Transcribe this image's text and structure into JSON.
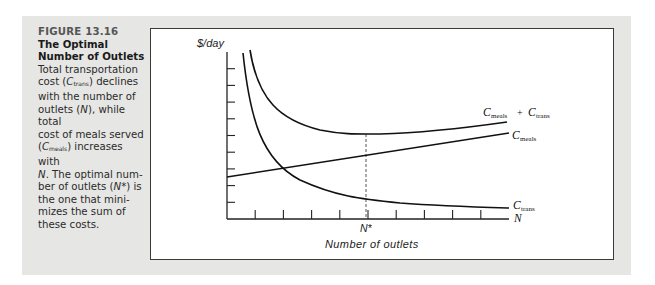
{
  "caption": {
    "figure_label": "FIGURE 13.16",
    "title_line1": "The Optimal",
    "title_line2": "Number of Outlets",
    "body_lines": [
      [
        "Total transportation"
      ],
      [
        "cost (",
        "C",
        "trans",
        ") declines"
      ],
      [
        "with the number of"
      ],
      [
        "outlets (",
        "N",
        "), while total"
      ],
      [
        "cost of meals served"
      ],
      [
        "(",
        "C",
        "meals",
        ") increases with"
      ],
      [
        "N",
        ". The optimal num-"
      ],
      [
        "ber of outlets (",
        "N*",
        ") is"
      ],
      [
        "the one that mini-"
      ],
      [
        "mizes the sum of"
      ],
      [
        "these costs."
      ]
    ]
  },
  "chart_data": {
    "type": "line",
    "title": "The Optimal Number of Outlets",
    "xlabel": "Number of outlets",
    "ylabel": "$/day",
    "x_axis_end_label": "N",
    "grid": false,
    "legend_position": "inline-right",
    "x_tick_count": 9,
    "y_tick_count": 9,
    "annotations": [
      {
        "label": "N*",
        "type": "vertical-dashed-line",
        "x": 5
      }
    ],
    "x": [
      0.6,
      1,
      1.5,
      2,
      3,
      4,
      5,
      6,
      7,
      8,
      9.6
    ],
    "series": [
      {
        "name": "C_trans",
        "label_main": "C",
        "label_sub": "trans",
        "values": [
          9.9,
          7.2,
          5.4,
          4.4,
          3.2,
          2.5,
          2.0,
          1.7,
          1.4,
          1.2,
          0.95
        ]
      },
      {
        "name": "C_meals",
        "label_main": "C",
        "label_sub": "meals",
        "values": [
          2.7,
          3.0,
          3.1,
          3.2,
          3.4,
          3.7,
          3.9,
          4.1,
          4.3,
          4.5,
          5.0
        ]
      },
      {
        "name": "C_meals + C_trans",
        "label_main": "C",
        "label_sub": "meals",
        "label_plus": "+",
        "label_main2": "C",
        "label_sub2": "trans",
        "values": [
          null,
          10.1,
          8.3,
          7.3,
          6.5,
          6.0,
          5.8,
          5.85,
          5.9,
          6.0,
          6.3
        ]
      }
    ],
    "ylim": [
      0,
      10
    ],
    "xlim": [
      0,
      10
    ]
  },
  "axis": {
    "y_label": "$/day",
    "x_label": "Number of outlets",
    "x_end": "N",
    "n_star": "N*"
  },
  "labels": {
    "sum_C1": "C",
    "sum_sub1": "meals",
    "sum_plus": "+",
    "sum_C2": "C",
    "sum_sub2": "trans",
    "meals_C": "C",
    "meals_sub": "meals",
    "trans_C": "C",
    "trans_sub": "trans"
  }
}
